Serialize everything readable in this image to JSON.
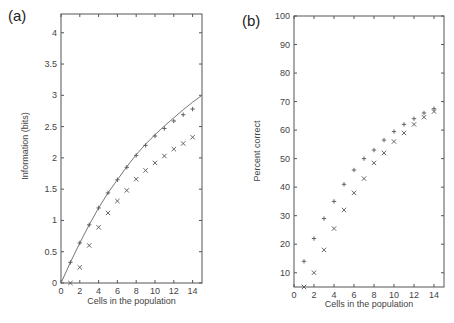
{
  "chart_data": [
    {
      "panel": "(a)",
      "type": "scatter",
      "title": "",
      "xlabel": "Cells in the population",
      "ylabel": "Information (bits)",
      "xlim": [
        0,
        15
      ],
      "ylim": [
        0,
        4.3
      ],
      "x_ticks": [
        0,
        2,
        4,
        6,
        8,
        10,
        12,
        14
      ],
      "y_ticks": [
        0,
        0.5,
        1,
        1.5,
        2,
        2.5,
        3,
        3.5,
        4
      ],
      "y_tick_labels": [
        "0",
        "0.5",
        "1",
        "1.5",
        "2",
        "2.5",
        "3",
        "3.5",
        "4"
      ],
      "grid": false,
      "legend": null,
      "x": [
        1,
        2,
        3,
        4,
        5,
        6,
        7,
        8,
        9,
        10,
        11,
        12,
        13,
        14
      ],
      "series": [
        {
          "name": "plus",
          "marker": "+",
          "values": [
            0.33,
            0.64,
            0.93,
            1.2,
            1.44,
            1.65,
            1.85,
            2.04,
            2.2,
            2.35,
            2.47,
            2.59,
            2.69,
            2.78
          ]
        },
        {
          "name": "cross",
          "marker": "x",
          "values": [
            0.0,
            0.25,
            0.6,
            0.89,
            1.12,
            1.31,
            1.48,
            1.66,
            1.8,
            1.92,
            2.03,
            2.14,
            2.23,
            2.33
          ]
        }
      ],
      "curve": {
        "name": "line",
        "x": [
          0,
          1,
          2,
          3,
          4,
          5,
          6,
          7,
          8,
          9,
          10,
          11,
          12,
          13,
          14,
          15
        ],
        "values": [
          0,
          0.33,
          0.64,
          0.93,
          1.2,
          1.44,
          1.65,
          1.86,
          2.05,
          2.22,
          2.37,
          2.51,
          2.64,
          2.77,
          2.89,
          3.0
        ]
      }
    },
    {
      "panel": "(b)",
      "type": "scatter",
      "title": "",
      "xlabel": "Cells in the population",
      "ylabel": "Percent correct",
      "xlim": [
        0,
        15
      ],
      "ylim": [
        5,
        100
      ],
      "x_ticks": [
        0,
        2,
        4,
        6,
        8,
        10,
        12,
        14
      ],
      "y_ticks": [
        10,
        20,
        30,
        40,
        50,
        60,
        70,
        80,
        90,
        100
      ],
      "grid": false,
      "legend": null,
      "x": [
        1,
        2,
        3,
        4,
        5,
        6,
        7,
        8,
        9,
        10,
        11,
        12,
        13,
        14
      ],
      "series": [
        {
          "name": "plus",
          "marker": "+",
          "values": [
            14,
            22,
            29,
            35,
            41,
            46,
            50,
            53,
            56.5,
            59.5,
            62,
            64,
            66,
            67.5
          ]
        },
        {
          "name": "cross",
          "marker": "x",
          "values": [
            5,
            10,
            18,
            25.5,
            32,
            38,
            43,
            48.5,
            52,
            56,
            59,
            62,
            64.5,
            66.5
          ]
        }
      ]
    }
  ],
  "panels": {
    "a": {
      "label": "(a)",
      "xlabel": "Cells in the population",
      "ylabel": "Information (bits)"
    },
    "b": {
      "label": "(b)",
      "xlabel": "Cells in the population",
      "ylabel": "Percent correct"
    }
  },
  "colors": {
    "axis": "#555555",
    "marker": "#555555",
    "curve": "#777777",
    "text": "#444444"
  }
}
